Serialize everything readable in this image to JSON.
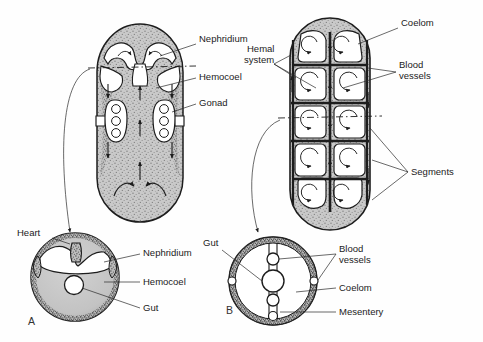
{
  "figure": {
    "background_color": "#fefefe",
    "ink_color": "#1d1d1d",
    "body_fill_color": "#c9c9c9",
    "cavity_fill_color": "#ffffff",
    "texture_color": "#7a7a7a",
    "panels": [
      {
        "id": "A",
        "letter": "A",
        "description": "hemocoelomate body plan"
      },
      {
        "id": "B",
        "letter": "B",
        "description": "coelomate segmented body plan"
      }
    ]
  },
  "labels": {
    "nephridium_top": "Nephridium",
    "hemocoel_top": "Hemocoel",
    "gonad": "Gonad",
    "hemal_system_line1": "Hemal",
    "hemal_system_line2": "system",
    "coelom_top": "Coelom",
    "blood_vessels_top_line1": "Blood",
    "blood_vessels_top_line2": "vessels",
    "segments": "Segments",
    "heart": "Heart",
    "nephridium_section": "Nephridium",
    "hemocoel_section": "Hemocoel",
    "gut_section_a": "Gut",
    "gut_section_b": "Gut",
    "blood_vessels_bottom_line1": "Blood",
    "blood_vessels_bottom_line2": "vessels",
    "coelom_bottom": "Coelom",
    "mesentery": "Mesentery",
    "panel_a": "A",
    "panel_b": "B"
  },
  "structures": {
    "panel_a_longitudinal": {
      "gonad_pairs": 2,
      "gonad_cells_each": 3,
      "flow_arrows": 9,
      "section_plane": "dashed"
    },
    "panel_a_cross_section": {
      "parts": [
        "heart",
        "nephridium",
        "hemocoel",
        "gut"
      ]
    },
    "panel_b_longitudinal": {
      "segment_rows": 5,
      "segment_columns": 2,
      "chambers": 10,
      "spiral_arrows": 10,
      "section_plane": "dashed"
    },
    "panel_b_cross_section": {
      "parts": [
        "gut",
        "blood vessels",
        "coelom",
        "mesentery"
      ],
      "lateral_vessels": 2,
      "dorsal_vessels": 1,
      "ventral_vessels": 2
    }
  }
}
